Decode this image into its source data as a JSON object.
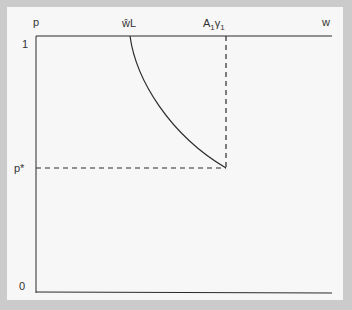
{
  "diagram": {
    "axis_labels": {
      "y_axis": "p",
      "x_axis": "w",
      "y_top": "1",
      "y_bottom": "0",
      "y_mid": "p*"
    },
    "x_markers": {
      "left": "ŵL",
      "right_main": "A",
      "right_sub1": "1",
      "right_gamma": "γ",
      "right_sub2": "1"
    },
    "colors": {
      "frame": "#cbcbcb",
      "panel": "#f7f7f7",
      "line": "#2a2a2a"
    }
  }
}
